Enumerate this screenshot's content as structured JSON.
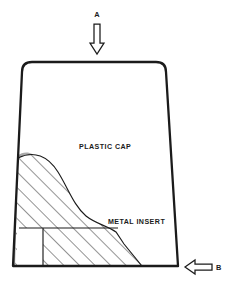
{
  "figure": {
    "background_color": "#ffffff",
    "outline_color": "#1b1b1b",
    "hatch_color": "#3a3a3a",
    "shade_color": "#a0a0a0",
    "labels": {
      "plastic_cap": "PLASTIC CAP",
      "metal_insert": "METAL INSERT"
    },
    "arrows": [
      {
        "id": "arrow-a",
        "label": "A",
        "direction": "down",
        "tip_x": 97,
        "tip_y": 54,
        "tail_y": 24,
        "label_x": 97,
        "label_y": 17
      },
      {
        "id": "arrow-b",
        "label": "B",
        "direction": "left",
        "tip_x": 185,
        "tip_y": 267,
        "tail_x": 212,
        "label_x": 218,
        "label_y": 270
      }
    ],
    "regions": [
      {
        "id": "plastic-cap-body",
        "name": "plastic cap outline",
        "fill": "#ffffff"
      },
      {
        "id": "metal-insert-hatch",
        "name": "metal insert hatched region",
        "fill": "diagonal-hatch"
      },
      {
        "id": "left-shade-strip",
        "name": "shaded left wall strip",
        "fill": "#a0a0a0"
      },
      {
        "id": "bottom-left-notch",
        "name": "white rectangular notch",
        "fill": "#ffffff"
      }
    ]
  }
}
